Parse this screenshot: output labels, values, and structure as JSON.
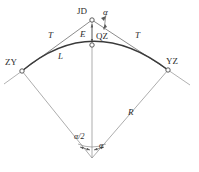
{
  "figure": {
    "background_color": "#ffffff",
    "line_color": "#7a7a7a",
    "arc_color": "#3a3a3a",
    "text_color": "#2b2b2b",
    "width": 199,
    "height": 172
  },
  "points": {
    "jd": {
      "label": "JD",
      "name": "intersection-point",
      "x": 92,
      "y": 20
    },
    "zy": {
      "label": "ZY",
      "name": "curve-start-point",
      "x": 22,
      "y": 71
    },
    "yz": {
      "label": "YZ",
      "name": "curve-end-point",
      "x": 168,
      "y": 70
    },
    "qz": {
      "label": "QZ",
      "name": "curve-midpoint",
      "x": 92,
      "y": 45
    },
    "center": {
      "label": "",
      "name": "curve-center-point",
      "x": 92,
      "y": 158
    }
  },
  "labels": {
    "jd": "JD",
    "zy": "ZY",
    "yz": "YZ",
    "qz": "QZ",
    "tangent_left": "T",
    "tangent_right": "T",
    "arc_length": "L",
    "external": "E",
    "radius": "R",
    "alpha": "α",
    "alpha_top": "α",
    "alpha_half": "α/2"
  },
  "elements": {
    "tangent_left_name": "tangent-distance-left",
    "tangent_right_name": "tangent-distance-right",
    "arc_name": "curve-arc",
    "external_name": "external-distance",
    "radius_left_name": "radius-left",
    "radius_right_name": "radius-right",
    "deflection_angle_name": "deflection-angle",
    "half_angle_name": "half-central-angle"
  }
}
